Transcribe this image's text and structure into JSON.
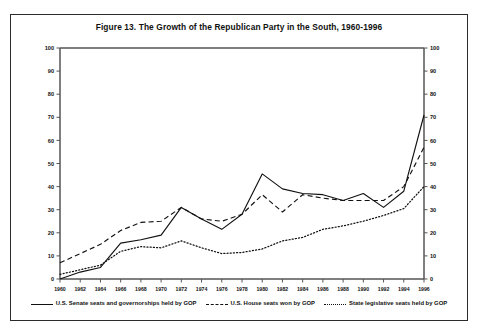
{
  "figure": {
    "title": "Figure 13.  The Growth of the Republican Party in the South, 1960-1996"
  },
  "legend": {
    "items": [
      {
        "label": "U.S. Senate seats and governorships held by GOP",
        "style": "solid"
      },
      {
        "label": "U.S. House seats won by GOP",
        "style": "dashed"
      },
      {
        "label": "State legislative seats held by GOP",
        "style": "dotted"
      }
    ]
  },
  "chart_data": {
    "type": "line",
    "title": "Figure 13.  The Growth of the Republican Party in the South, 1960-1996",
    "xlabel": "",
    "ylabel": "",
    "xlim": [
      1960,
      1996
    ],
    "ylim": [
      0,
      100
    ],
    "ytick_step": 10,
    "grid": false,
    "legend_position": "bottom",
    "dual_y_axis": true,
    "x": [
      1960,
      1962,
      1964,
      1966,
      1968,
      1970,
      1972,
      1974,
      1976,
      1978,
      1980,
      1982,
      1984,
      1986,
      1988,
      1990,
      1992,
      1994,
      1996
    ],
    "xticklabels": [
      "1960",
      "1962",
      "1964",
      "1966",
      "1968",
      "1970",
      "1972",
      "1974",
      "1976",
      "1978",
      "1980",
      "1982",
      "1984",
      "1986",
      "1988",
      "1990",
      "1992",
      "1994",
      "1996"
    ],
    "yticklabels": [
      "0",
      "10",
      "20",
      "30",
      "40",
      "50",
      "60",
      "70",
      "80",
      "90",
      "100"
    ],
    "series": [
      {
        "name": "U.S. Senate seats and governorships held by GOP",
        "style": "solid",
        "color": "#111111",
        "values": [
          0,
          3,
          5,
          15.5,
          17,
          19,
          31,
          26,
          21.5,
          28,
          45.5,
          39,
          37,
          36.5,
          34,
          37,
          31,
          38,
          71
        ]
      },
      {
        "name": "U.S. House seats won by GOP",
        "style": "dashed",
        "color": "#111111",
        "values": [
          7,
          11,
          15,
          21,
          24.5,
          25,
          31,
          26,
          25,
          28,
          36.5,
          29,
          36.5,
          35,
          34,
          34,
          34,
          40,
          57
        ]
      },
      {
        "name": "State legislative seats held by GOP",
        "style": "dotted",
        "color": "#111111",
        "values": [
          2,
          4,
          6,
          12,
          14,
          13.5,
          16.5,
          13.5,
          11,
          11.5,
          13,
          16.5,
          18,
          21.5,
          23,
          25,
          27.5,
          30.5,
          40
        ]
      }
    ]
  }
}
